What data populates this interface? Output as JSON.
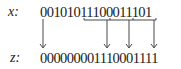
{
  "diagram": {
    "input": {
      "label": "x:",
      "bits": "0010101110001110​1"
    },
    "output": {
      "label": "z:",
      "bits": "000000001110001111"
    },
    "connections": [
      {
        "from": "first bit",
        "to": "first bit"
      },
      {
        "from": "group 111",
        "to": "bit"
      },
      {
        "from": "group 000",
        "to": "bit"
      },
      {
        "from": "group 111",
        "to": "bit"
      }
    ]
  }
}
